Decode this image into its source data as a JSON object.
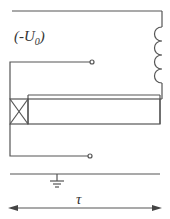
{
  "diagram": {
    "label_voltage": "(-U",
    "label_voltage_sub": "0",
    "label_voltage_close": ")",
    "label_tau": "τ",
    "colors": {
      "line": "#555555",
      "text": "#333333",
      "background": "#ffffff"
    },
    "components": [
      {
        "type": "wire",
        "name": "top-wire"
      },
      {
        "type": "inductor",
        "name": "coil",
        "turns": 4
      },
      {
        "type": "terminal",
        "name": "upper-terminal"
      },
      {
        "type": "terminal",
        "name": "lower-terminal"
      },
      {
        "type": "crossed-box",
        "name": "source-element"
      },
      {
        "type": "rectangle",
        "name": "transmission-line"
      },
      {
        "type": "ground",
        "name": "ground-symbol"
      },
      {
        "type": "double-arrow",
        "name": "tau-arrow"
      }
    ]
  }
}
